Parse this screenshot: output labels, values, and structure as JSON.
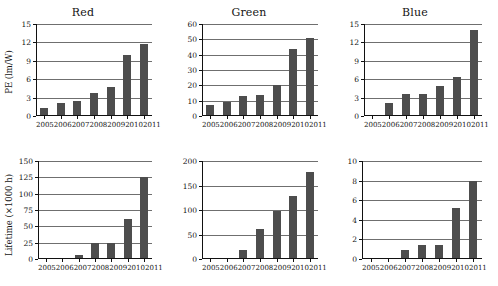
{
  "figure": {
    "background": "#ffffff",
    "bar_color": "#4d4d4d",
    "axis_color": "#111111",
    "grid_color": "#6f6f6f"
  },
  "chart_data": [
    {
      "type": "bar",
      "title": "Red",
      "panel_position": "top-left",
      "xlabel": "",
      "ylabel": "PE (lm/W)",
      "categories": [
        "2005",
        "2006",
        "2007",
        "2008",
        "2009",
        "2010",
        "2011"
      ],
      "values": [
        1.3,
        2.1,
        2.4,
        3.8,
        4.8,
        10.0,
        11.8
      ],
      "ylim": [
        0,
        15
      ],
      "yticks": [
        0,
        3,
        6,
        9,
        12,
        15
      ],
      "grid": true,
      "legend": "none"
    },
    {
      "type": "bar",
      "title": "Green",
      "panel_position": "top-center",
      "xlabel": "",
      "ylabel": "",
      "categories": [
        "2005",
        "2006",
        "2007",
        "2008",
        "2009",
        "2010",
        "2011"
      ],
      "values": [
        7,
        9,
        13,
        14,
        20,
        44,
        51
      ],
      "ylim": [
        0,
        60
      ],
      "yticks": [
        0,
        10,
        20,
        30,
        40,
        50,
        60
      ],
      "grid": true,
      "legend": "none"
    },
    {
      "type": "bar",
      "title": "Blue",
      "panel_position": "top-right",
      "xlabel": "",
      "ylabel": "",
      "categories": [
        "2005",
        "2006",
        "2007",
        "2008",
        "2009",
        "2010",
        "2011"
      ],
      "values": [
        0,
        2.2,
        3.6,
        3.6,
        4.9,
        6.4,
        14.1
      ],
      "ylim": [
        0,
        15
      ],
      "yticks": [
        0,
        3,
        6,
        9,
        12,
        15
      ],
      "grid": true,
      "legend": "none"
    },
    {
      "type": "bar",
      "title": "",
      "panel_position": "bottom-left",
      "xlabel": "",
      "ylabel": "Lifetime (×1000 h)",
      "categories": [
        "2005",
        "2006",
        "2007",
        "2008",
        "2009",
        "2010",
        "2011"
      ],
      "values": [
        0,
        1.5,
        6,
        25,
        25,
        62,
        126
      ],
      "ylim": [
        0,
        150
      ],
      "yticks": [
        0,
        25,
        50,
        75,
        100,
        125,
        150
      ],
      "grid": true,
      "legend": "none"
    },
    {
      "type": "bar",
      "title": "",
      "panel_position": "bottom-center",
      "xlabel": "",
      "ylabel": "",
      "categories": [
        "2005",
        "2006",
        "2007",
        "2008",
        "2009",
        "2010",
        "2011"
      ],
      "values": [
        0,
        2,
        19,
        62,
        99,
        128,
        177
      ],
      "ylim": [
        0,
        200
      ],
      "yticks": [
        0,
        50,
        100,
        150,
        200
      ],
      "grid": true,
      "legend": "none"
    },
    {
      "type": "bar",
      "title": "",
      "panel_position": "bottom-right",
      "xlabel": "",
      "ylabel": "",
      "categories": [
        "2005",
        "2006",
        "2007",
        "2008",
        "2009",
        "2010",
        "2011"
      ],
      "values": [
        0,
        0.1,
        0.9,
        1.4,
        1.4,
        5.2,
        8.0
      ],
      "ylim": [
        0,
        10
      ],
      "yticks": [
        0,
        2,
        4,
        6,
        8,
        10
      ],
      "grid": true,
      "legend": "none"
    }
  ]
}
